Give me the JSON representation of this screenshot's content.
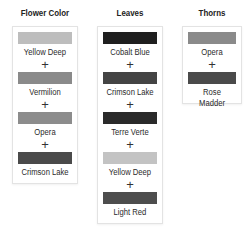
{
  "columns": [
    {
      "title": "Flower Color",
      "items": [
        {
          "name": "Yellow Deep",
          "color": "#bdbdbd"
        },
        {
          "name": "Vermilion",
          "color": "#8a8a8a"
        },
        {
          "name": "Opera",
          "color": "#8c8c8c"
        },
        {
          "name": "Crimson Lake",
          "color": "#4a4a4a"
        }
      ]
    },
    {
      "title": "Leaves",
      "items": [
        {
          "name": "Cobalt Blue",
          "color": "#1f1f1f"
        },
        {
          "name": "Crimson Lake",
          "color": "#444444"
        },
        {
          "name": "Terre Verte",
          "color": "#2a2a2a"
        },
        {
          "name": "Yellow Deep",
          "color": "#c3c3c3"
        },
        {
          "name": "Light Red",
          "color": "#4d4d4d"
        }
      ]
    },
    {
      "title": "Thorns",
      "items": [
        {
          "name": "Opera",
          "color": "#8a8a8a"
        },
        {
          "name": "Rose Madder",
          "color": "#4a4a4a"
        }
      ]
    }
  ],
  "separator": "+"
}
